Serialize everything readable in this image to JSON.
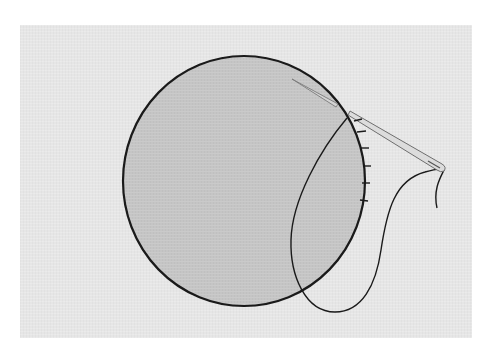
{
  "illustration": {
    "subject": "Hand stitching the edge of a circular fabric piece with a needle and thread",
    "colors": {
      "page_background": "#ffffff",
      "panel_background": "#e6e6e6",
      "circle_fill": "#c5c5c5",
      "outline": "#1a1a1a",
      "needle_fill": "#d9d9d9",
      "needle_stroke": "#6e6e6e",
      "thread": "#1a1a1a"
    },
    "circle": {
      "cx": 244,
      "cy": 181,
      "rx": 122,
      "ry": 125
    },
    "needle": {
      "tip": [
        292,
        79
      ],
      "eye": [
        443,
        168
      ]
    },
    "stitch_count": 6
  }
}
